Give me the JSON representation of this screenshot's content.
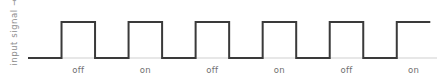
{
  "figure": {
    "y_axis_label": "input signal →",
    "axis_label_color": "#8d8d8d",
    "background_color": "#ffffff",
    "tick_label_color": "#6f6f6f"
  },
  "chart_data": {
    "type": "line",
    "title": "",
    "subtitle": "",
    "xlabel": "",
    "ylabel": "input signal →",
    "grid": false,
    "legend": null,
    "waveform": "square",
    "line_color": "#3a3a3a",
    "line_width": 2,
    "baseline_color": "#cfcfcf",
    "levels": {
      "low": 0,
      "high": 1
    },
    "ylim": [
      -0.15,
      1.25
    ],
    "xlim": [
      0,
      6.1
    ],
    "period": 1,
    "duty_cycle": 0.5,
    "pulse_count": 6,
    "x": [
      0.0,
      0.5,
      0.5,
      1.0,
      1.0,
      1.5,
      1.5,
      2.0,
      2.0,
      2.5,
      2.5,
      3.0,
      3.0,
      3.5,
      3.5,
      4.0,
      4.0,
      4.5,
      4.5,
      5.0,
      5.0,
      5.5,
      5.5,
      6.0
    ],
    "values": [
      0,
      0,
      1,
      1,
      0,
      0,
      1,
      1,
      0,
      0,
      1,
      1,
      0,
      0,
      1,
      1,
      0,
      0,
      1,
      1,
      0,
      0,
      1,
      1
    ],
    "tick_labels": [
      "off",
      "on",
      "off",
      "on",
      "off",
      "on"
    ],
    "tick_positions": [
      0.75,
      1.75,
      2.75,
      3.75,
      4.75,
      5.75
    ],
    "annotations": []
  },
  "geometry": {
    "plot_left": 28,
    "plot_right": 437,
    "baseline_y": 58,
    "peak_y": 22,
    "label_y": 65,
    "segment_width": 34.08
  }
}
